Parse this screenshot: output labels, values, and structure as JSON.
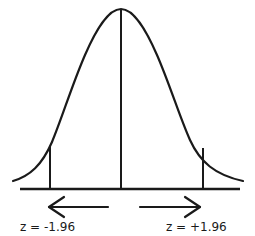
{
  "diagram": {
    "type": "normal-distribution-two-tailed",
    "labels": {
      "left_critical": "z = -1.96",
      "right_critical": "z = +1.96"
    },
    "colors": {
      "stroke": "#1a1a1a",
      "background": "#ffffff"
    },
    "arrows": {
      "left": "arrow-left",
      "right": "arrow-right"
    }
  }
}
